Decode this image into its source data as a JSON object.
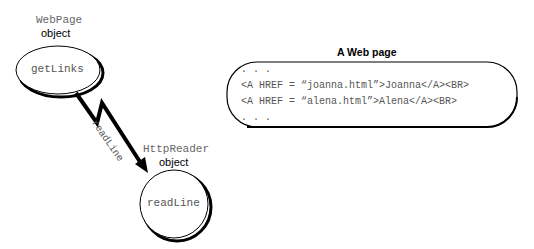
{
  "diagram": {
    "webpage_object": {
      "class_name": "WebPage",
      "kind": "object",
      "method": "getLinks"
    },
    "httpreader_object": {
      "class_name": "HttpReader",
      "kind": "object",
      "method": "readLine"
    },
    "message": {
      "label": "readLine",
      "icon": "lightning-arrow-icon"
    },
    "web_page": {
      "title": "A Web page",
      "lines": [
        ". . .",
        "<A HREF = “joanna.html”>Joanna</A><BR>",
        "<A HREF = “alena.html”>Alena</A><BR>",
        ". . ."
      ]
    }
  }
}
